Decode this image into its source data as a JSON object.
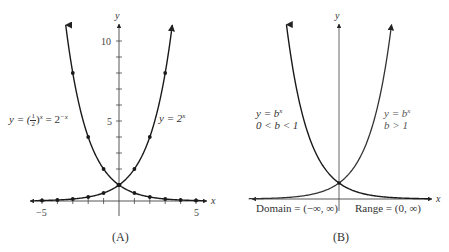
{
  "chart_data": [
    {
      "id": "A",
      "type": "line",
      "caption": "(A)",
      "xlabel": "x",
      "ylabel": "y",
      "xlim": [
        -5.5,
        5.5
      ],
      "ylim": [
        0,
        11
      ],
      "x_ticks": [
        -5,
        -4,
        -3,
        -2,
        -1,
        0,
        1,
        2,
        3,
        4,
        5
      ],
      "x_tick_labels": {
        "-5": "−5",
        "5": "5"
      },
      "y_ticks": [
        1,
        2,
        3,
        4,
        5,
        6,
        7,
        8,
        9,
        10
      ],
      "y_tick_labels": {
        "5": "5",
        "10": "10"
      },
      "series": [
        {
          "name": "y = 2^x",
          "label": "y = 2^x",
          "x": [
            -5,
            -4,
            -3,
            -2,
            -1,
            0,
            1,
            2,
            3
          ],
          "values": [
            0.03125,
            0.0625,
            0.125,
            0.25,
            0.5,
            1,
            2,
            4,
            8
          ]
        },
        {
          "name": "y = (1/2)^x = 2^-x",
          "label": "y = (1/2)^x = 2^-x",
          "x": [
            -3,
            -2,
            -1,
            0,
            1,
            2,
            3,
            4,
            5
          ],
          "values": [
            8,
            4,
            2,
            1,
            0.5,
            0.25,
            0.125,
            0.0625,
            0.03125
          ]
        }
      ],
      "grid": false
    },
    {
      "id": "B",
      "type": "line",
      "caption": "(B)",
      "xlabel": "x",
      "ylabel": "y",
      "series": [
        {
          "name": "y = b^x, 0 < b < 1",
          "label_line1": "y = b^x",
          "label_line2": "0 < b < 1"
        },
        {
          "name": "y = b^x, b > 1",
          "label_line1": "y = b^x",
          "label_line2": "b > 1"
        }
      ],
      "annotations": [
        "Domain = (−∞, ∞)",
        "Range = (0, ∞)"
      ],
      "grid": false
    }
  ],
  "panelA": {
    "y_axis_label": "y",
    "x_axis_label": "x",
    "tick_10": "10",
    "tick_5": "5",
    "tick_neg5": "−5",
    "tick_pos5": "5",
    "label_left_prefix": "y = (",
    "label_left_num": "1",
    "label_left_den": "2",
    "label_left_mid": ")",
    "label_left_exp": "x",
    "label_left_eq": " = 2",
    "label_left_exp2": "−x",
    "label_right_base": "y = 2",
    "label_right_exp": "x",
    "caption": "(A)"
  },
  "panelB": {
    "y_axis_label": "y",
    "x_axis_label": "x",
    "left_label_line1_base": "y = b",
    "left_label_line1_exp": "x",
    "left_label_line2": "0 < b < 1",
    "right_label_line1_base": "y = b",
    "right_label_line1_exp": "x",
    "right_label_line2": "b > 1",
    "domain": "Domain = (−∞, ∞)",
    "range": "Range = (0, ∞)",
    "caption": "(B)"
  },
  "colors": {
    "curve": "#1a1a1a",
    "curve_light": "#555555",
    "axis": "#444444",
    "text": "#333333"
  }
}
